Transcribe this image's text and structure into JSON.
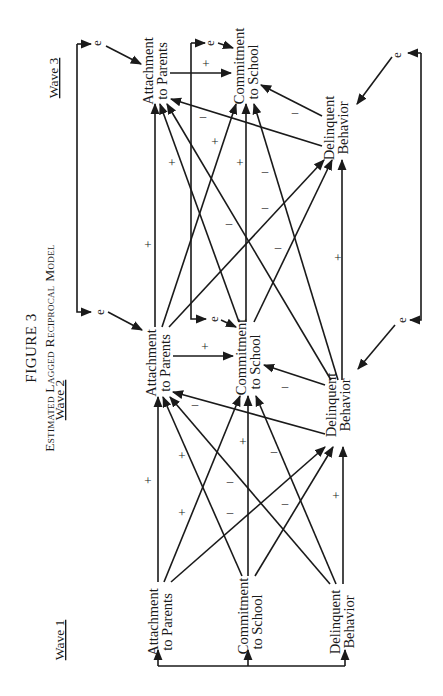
{
  "figure": {
    "number_label": "FIGURE 3",
    "title": "Estimated Lagged Reciprocal Model",
    "orientation": "rotated-90-ccw"
  },
  "waves": [
    {
      "id": "w1",
      "label": "Wave 1"
    },
    {
      "id": "w2",
      "label": "Wave 2"
    },
    {
      "id": "w3",
      "label": "Wave 3"
    }
  ],
  "constructs": [
    {
      "id": "att",
      "line1": "Attachment",
      "line2": "to Parents"
    },
    {
      "id": "com",
      "line1": "Commitment",
      "line2": "to School"
    },
    {
      "id": "del",
      "line1": "Delinquent",
      "line2": "Behavior"
    }
  ],
  "error_term_label": "e",
  "paths": {
    "w1_to_w2": [
      {
        "from": "att",
        "to": "att",
        "sign": "+"
      },
      {
        "from": "att",
        "to": "com",
        "sign": "+"
      },
      {
        "from": "att",
        "to": "del",
        "sign": "-"
      },
      {
        "from": "com",
        "to": "att",
        "sign": "+"
      },
      {
        "from": "com",
        "to": "com",
        "sign": "+"
      },
      {
        "from": "com",
        "to": "del",
        "sign": "-"
      },
      {
        "from": "del",
        "to": "att",
        "sign": "-"
      },
      {
        "from": "del",
        "to": "com",
        "sign": "-"
      },
      {
        "from": "del",
        "to": "del",
        "sign": "+"
      }
    ],
    "w2_within": [
      {
        "from": "att",
        "to": "com",
        "sign": "+"
      },
      {
        "from": "del",
        "to": "com",
        "sign": "-"
      },
      {
        "from": "del",
        "to": "att",
        "sign": "-"
      }
    ],
    "w2_to_w3": [
      {
        "from": "att",
        "to": "att",
        "sign": "+"
      },
      {
        "from": "att",
        "to": "com",
        "sign": "+"
      },
      {
        "from": "att",
        "to": "del",
        "sign": "-"
      },
      {
        "from": "com",
        "to": "att",
        "sign": "+"
      },
      {
        "from": "com",
        "to": "com",
        "sign": "+"
      },
      {
        "from": "com",
        "to": "del",
        "sign": "-"
      },
      {
        "from": "del",
        "to": "att",
        "sign": "-"
      },
      {
        "from": "del",
        "to": "com",
        "sign": "-"
      },
      {
        "from": "del",
        "to": "del",
        "sign": "+"
      }
    ],
    "w3_within": [
      {
        "from": "att",
        "to": "com",
        "sign": "+"
      },
      {
        "from": "del",
        "to": "com",
        "sign": "-"
      },
      {
        "from": "del",
        "to": "att",
        "sign": "-"
      }
    ]
  },
  "wave1_correlations": "all three Wave 1 constructs connected by a common bracket with arrows"
}
